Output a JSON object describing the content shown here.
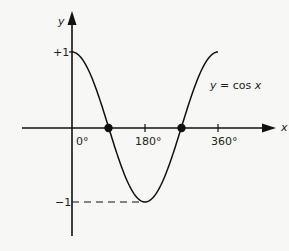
{
  "chart_data": {
    "type": "line",
    "title": "",
    "function_label": "y = cos x",
    "xlabel": "x",
    "ylabel": "y",
    "x_ticks": [
      {
        "value": 0,
        "label": "0°"
      },
      {
        "value": 180,
        "label": "180°"
      },
      {
        "value": 360,
        "label": "360°"
      }
    ],
    "y_ticks": [
      {
        "value": 1,
        "label": "+1"
      },
      {
        "value": -1,
        "label": "−1"
      }
    ],
    "xlim": [
      -70,
      420
    ],
    "ylim": [
      -1.7,
      1.55
    ],
    "series": [
      {
        "name": "y = cos x",
        "x": [
          0,
          30,
          60,
          90,
          120,
          150,
          180,
          210,
          240,
          270,
          300,
          330,
          360
        ],
        "values": [
          1,
          0.866,
          0.5,
          0,
          -0.5,
          -0.866,
          -1,
          -0.866,
          -0.5,
          0,
          0.5,
          0.866,
          1
        ]
      }
    ],
    "marked_points": [
      {
        "x": 90,
        "y": 0
      },
      {
        "x": 270,
        "y": 0
      }
    ],
    "annotations": [
      {
        "type": "dashed-line",
        "from": [
          0,
          -1
        ],
        "to": [
          180,
          -1
        ]
      }
    ],
    "grid": false,
    "legend": "none"
  },
  "labels": {
    "y_axis": "y",
    "x_axis": "x",
    "plus_one": "+1",
    "minus_one": "−1",
    "zero_deg": "0°",
    "deg_180": "180°",
    "deg_360": "360°",
    "curve_label_lhs": "y",
    "curve_label_eq": " = cos ",
    "curve_label_rhs": "x"
  }
}
